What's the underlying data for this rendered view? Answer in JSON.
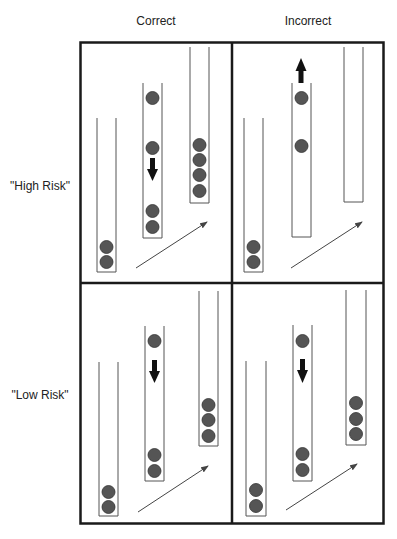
{
  "columns": [
    {
      "label": "Correct"
    },
    {
      "label": "Incorrect"
    }
  ],
  "rows": [
    {
      "label": "\"High Risk\""
    },
    {
      "label": "\"Low Risk\""
    }
  ],
  "colors": {
    "frame": "#1a1a1a",
    "tube": "#555555",
    "ball": "#555555",
    "ball_edge": "#333333",
    "arrow_block": "#111111",
    "arrow_line": "#444444"
  },
  "panels": [
    {
      "id": "high-correct",
      "tubes": [
        {
          "balls": 2
        },
        {
          "balls": 4,
          "direction_arrow": "down"
        },
        {
          "balls": 4
        }
      ]
    },
    {
      "id": "high-incorrect",
      "tubes": [
        {
          "balls": 2
        },
        {
          "balls": 2,
          "direction_arrow": "up"
        },
        {
          "balls": 0
        }
      ]
    },
    {
      "id": "low-correct",
      "tubes": [
        {
          "balls": 2
        },
        {
          "balls": 3,
          "direction_arrow": "down"
        },
        {
          "balls": 3
        }
      ]
    },
    {
      "id": "low-incorrect",
      "tubes": [
        {
          "balls": 2
        },
        {
          "balls": 3,
          "direction_arrow": "down"
        },
        {
          "balls": 3
        }
      ]
    }
  ]
}
